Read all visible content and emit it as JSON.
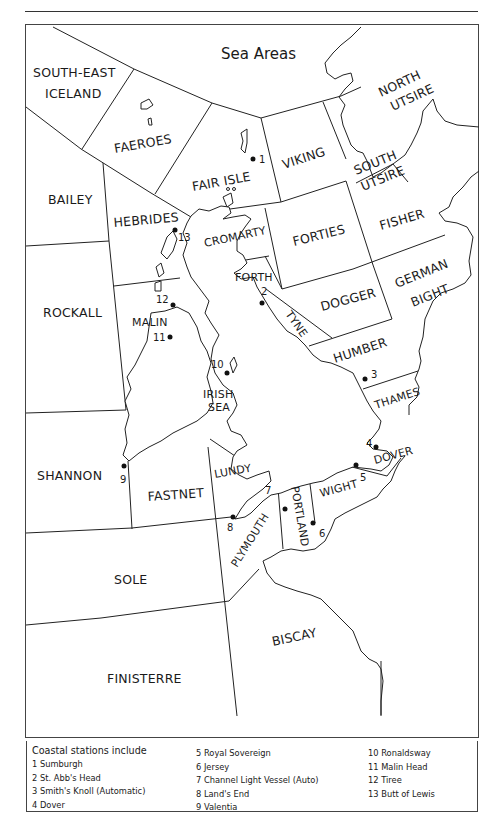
{
  "map": {
    "title": "Sea Areas",
    "sea_areas": [
      {
        "id": "south-east-iceland",
        "label_lines": [
          "SOUTH-EAST",
          "ICELAND"
        ]
      },
      {
        "id": "faeroes",
        "label": "FAEROES"
      },
      {
        "id": "fair-isle",
        "label": "FAIR ISLE"
      },
      {
        "id": "viking",
        "label": "VIKING"
      },
      {
        "id": "north-utsire",
        "label_lines": [
          "NORTH",
          "UTSIRE"
        ]
      },
      {
        "id": "south-utsire",
        "label_lines": [
          "SOUTH",
          "UTSIRE"
        ]
      },
      {
        "id": "bailey",
        "label": "BAILEY"
      },
      {
        "id": "hebrides",
        "label": "HEBRIDES"
      },
      {
        "id": "cromarty",
        "label": "CROMARTY"
      },
      {
        "id": "forties",
        "label": "FORTIES"
      },
      {
        "id": "fisher",
        "label": "FISHER"
      },
      {
        "id": "forth",
        "label": "FORTH"
      },
      {
        "id": "dogger",
        "label": "DOGGER"
      },
      {
        "id": "german-bight",
        "label_lines": [
          "GERMAN",
          "BIGHT"
        ]
      },
      {
        "id": "rockall",
        "label": "ROCKALL"
      },
      {
        "id": "malin",
        "label": "MALIN"
      },
      {
        "id": "tyne",
        "label": "TYNE"
      },
      {
        "id": "humber",
        "label": "HUMBER"
      },
      {
        "id": "irish-sea",
        "label_lines": [
          "IRISH",
          "SEA"
        ]
      },
      {
        "id": "thames",
        "label": "THAMES"
      },
      {
        "id": "shannon",
        "label": "SHANNON"
      },
      {
        "id": "fastnet",
        "label": "FASTNET"
      },
      {
        "id": "lundy",
        "label": "LUNDY"
      },
      {
        "id": "dover",
        "label": "DOVER"
      },
      {
        "id": "wight",
        "label": "WIGHT"
      },
      {
        "id": "portland",
        "label": "PORTLAND"
      },
      {
        "id": "plymouth",
        "label": "PLYMOUTH"
      },
      {
        "id": "sole",
        "label": "SOLE"
      },
      {
        "id": "biscay",
        "label": "BISCAY"
      },
      {
        "id": "finisterre",
        "label": "FINISTERRE"
      }
    ],
    "station_markers": [
      "1",
      "2",
      "3",
      "4",
      "5",
      "6",
      "7",
      "8",
      "9",
      "10",
      "11",
      "12",
      "13"
    ]
  },
  "legend": {
    "heading": "Coastal stations include",
    "stations": [
      "1 Sumburgh",
      "2 St. Abb's Head",
      "3 Smith's Knoll (Automatic)",
      "4 Dover",
      "5 Royal Sovereign",
      "6 Jersey",
      "7 Channel Light Vessel (Auto)",
      "8 Land's End",
      "9 Valentia",
      "10 Ronaldsway",
      "11 Malin Head",
      "12 Tiree",
      "13 Butt of Lewis"
    ]
  }
}
